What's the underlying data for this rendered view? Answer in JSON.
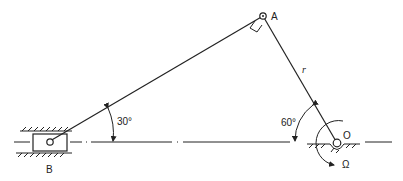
{
  "diagram": {
    "type": "slider-crank mechanism",
    "points": {
      "A": {
        "label": "A"
      },
      "B": {
        "label": "B"
      },
      "O": {
        "label": "O"
      }
    },
    "link_labels": {
      "crank": "r"
    },
    "angles": {
      "at_B": "30°",
      "at_O": "60°"
    },
    "angular_velocity": "Ω",
    "right_angle_at": "A",
    "colors": {
      "line": "#222222",
      "background": "#ffffff"
    }
  }
}
